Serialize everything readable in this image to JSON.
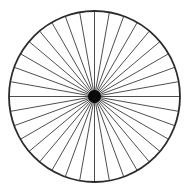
{
  "figure": {
    "canvas": {
      "width": 189,
      "height": 194,
      "background_color": "#ffffff"
    }
  },
  "chart_data": {
    "type": "scatter",
    "title": "",
    "subtitle": "",
    "xlabel": "",
    "ylabel": "",
    "grid": false,
    "legend": null,
    "axis_visible": false,
    "tick_labels": [],
    "annotations": [],
    "geometry": {
      "center_x": 94.5,
      "center_y": 96.5,
      "rim_radius": 85.5,
      "hub_radius": 6.5,
      "spoke_count": 36,
      "spoke_angle_step_deg": 10,
      "spoke_start_angle_deg": 0,
      "rim_stroke_width": 1.8,
      "spoke_stroke_width": 0.9
    },
    "categories": [
      "0",
      "10",
      "20",
      "30",
      "40",
      "50",
      "60",
      "70",
      "80",
      "90",
      "100",
      "110",
      "120",
      "130",
      "140",
      "150",
      "160",
      "170",
      "180",
      "190",
      "200",
      "210",
      "220",
      "230",
      "240",
      "250",
      "260",
      "270",
      "280",
      "290",
      "300",
      "310",
      "320",
      "330",
      "340",
      "350"
    ],
    "values": [
      85.5,
      85.5,
      85.5,
      85.5,
      85.5,
      85.5,
      85.5,
      85.5,
      85.5,
      85.5,
      85.5,
      85.5,
      85.5,
      85.5,
      85.5,
      85.5,
      85.5,
      85.5,
      85.5,
      85.5,
      85.5,
      85.5,
      85.5,
      85.5,
      85.5,
      85.5,
      85.5,
      85.5,
      85.5,
      85.5,
      85.5,
      85.5,
      85.5,
      85.5,
      85.5,
      85.5
    ]
  },
  "colors": {
    "background": "#ffffff",
    "rim_stroke": "#2b2b2b",
    "spoke_stroke": "#3a3a3a",
    "hub_fill": "#0a0a0a"
  }
}
